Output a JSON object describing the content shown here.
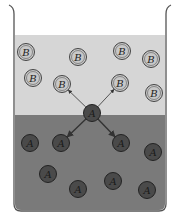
{
  "diagram": {
    "colors": {
      "background": "#ffffff",
      "beaker_outline": "#555555",
      "upper_layer": "#d6d6d6",
      "lower_layer": "#7a7a7a",
      "b_fill": "#c8c8c8",
      "b_stroke": "#444444",
      "a_fill": "#4a4a4a",
      "a_stroke": "#222222",
      "arrow": "#333333"
    },
    "beaker": {
      "left": 14,
      "right": 166,
      "top": 8,
      "bottom": 210,
      "liquid_top": 35,
      "interface_y": 115
    },
    "b_particles": [
      {
        "label": "B",
        "x": 26,
        "y": 52
      },
      {
        "label": "B",
        "x": 78,
        "y": 57
      },
      {
        "label": "B",
        "x": 122,
        "y": 51
      },
      {
        "label": "B",
        "x": 151,
        "y": 59
      },
      {
        "label": "B",
        "x": 33,
        "y": 78
      },
      {
        "label": "B",
        "x": 62,
        "y": 84
      },
      {
        "label": "B",
        "x": 120,
        "y": 83
      },
      {
        "label": "B",
        "x": 154,
        "y": 93
      }
    ],
    "a_particles": [
      {
        "label": "A",
        "x": 30,
        "y": 143
      },
      {
        "label": "A",
        "x": 61,
        "y": 143
      },
      {
        "label": "A",
        "x": 121,
        "y": 143
      },
      {
        "label": "A",
        "x": 153,
        "y": 152
      },
      {
        "label": "A",
        "x": 48,
        "y": 174
      },
      {
        "label": "A",
        "x": 78,
        "y": 189
      },
      {
        "label": "A",
        "x": 113,
        "y": 181
      },
      {
        "label": "A",
        "x": 147,
        "y": 190
      }
    ],
    "center_particle": {
      "label": "A",
      "x": 92,
      "y": 113
    },
    "arrows_to": [
      {
        "target": "B",
        "x": 62,
        "y": 84
      },
      {
        "target": "B",
        "x": 120,
        "y": 83
      },
      {
        "target": "A",
        "x": 61,
        "y": 143
      },
      {
        "target": "A",
        "x": 121,
        "y": 143
      }
    ]
  }
}
